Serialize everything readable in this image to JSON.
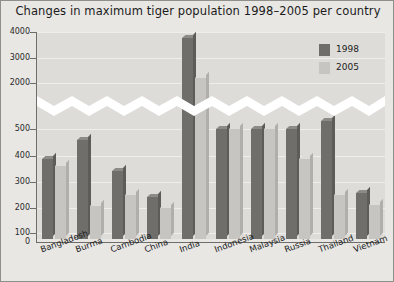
{
  "chart_data": {
    "type": "bar",
    "title": "Changes in maximum tiger population 1998–2005 per country",
    "xlabel": "",
    "ylabel": "",
    "categories": [
      "Bangladesh",
      "Burma",
      "Cambodia",
      "China",
      "India",
      "Indonesia",
      "Malaysia",
      "Russia",
      "Thailand",
      "Vietnam"
    ],
    "series": [
      {
        "name": "1998",
        "color": "#6f6e6b",
        "values": [
          362,
          450,
          310,
          190,
          3770,
          500,
          500,
          500,
          505,
          210
        ]
      },
      {
        "name": "2005",
        "color": "#c6c5c1",
        "values": [
          330,
          150,
          200,
          140,
          2200,
          500,
          500,
          365,
          200,
          155
        ]
      }
    ],
    "y_ticks_upper": [
      2000,
      3000,
      4000
    ],
    "y_ticks_lower": [
      0,
      100,
      200,
      300,
      400,
      500
    ],
    "y_tick_labels": [
      "4000",
      "3000",
      "2000",
      "500",
      "400",
      "300",
      "200",
      "100",
      "0"
    ],
    "axis_break": true,
    "axis_break_note": "y-axis broken between 500 and 2000",
    "grid": true,
    "legend_position": "top-right",
    "ylim_lower": [
      0,
      560
    ],
    "ylim_upper": [
      1900,
      4200
    ]
  },
  "legend": {
    "entries": [
      {
        "label": "1998",
        "swatch": "dark-gray"
      },
      {
        "label": "2005",
        "swatch": "light-gray"
      }
    ]
  },
  "axis": {
    "zero_label": "0"
  }
}
